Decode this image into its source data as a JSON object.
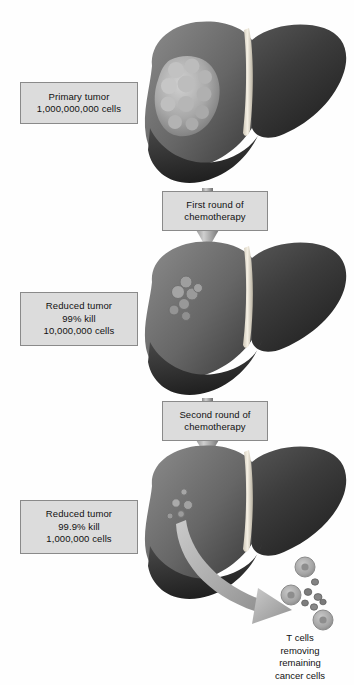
{
  "figure": {
    "title_text": "Tumor cell kill with successive rounds of chemotherapy",
    "background_color": "#ffffff",
    "box_fill": "#dcdcdc",
    "box_border": "#8a8a8a",
    "arrow_color": "#9a9a9a",
    "liver_dark": "#3a3a3a",
    "liver_mid": "#6e6e6e",
    "liver_light": "#9d9d9d",
    "ligament_color": "#efeadd",
    "tumor_color": "#b9b9b9",
    "tcell_color": "#a9a9a9",
    "cancer_cell_color": "#7c7c7c"
  },
  "stages": [
    {
      "id": "stage-1",
      "label_lines": [
        "Primary tumor",
        "1,000,000,000 cells"
      ],
      "cells": "1,000,000,000",
      "kill": "",
      "tumor_size": "large"
    },
    {
      "id": "stage-2",
      "label_lines": [
        "Reduced tumor",
        "99% kill",
        "10,000,000 cells"
      ],
      "cells": "10,000,000",
      "kill": "99%",
      "tumor_size": "small"
    },
    {
      "id": "stage-3",
      "label_lines": [
        "Reduced tumor",
        "99.9% kill",
        "1,000,000 cells"
      ],
      "cells": "1,000,000",
      "kill": "99.9%",
      "tumor_size": "tiny"
    }
  ],
  "treatments": [
    {
      "id": "treatment-1",
      "lines": [
        "First round of",
        "chemotherapy"
      ]
    },
    {
      "id": "treatment-2",
      "lines": [
        "Second round of",
        "chemotherapy"
      ]
    }
  ],
  "tcell_caption": {
    "lines": [
      "T cells",
      "removing",
      "remaining",
      "cancer cells"
    ]
  },
  "icons": {
    "down_arrow": "down-arrow-icon",
    "curved_arrow": "curved-arrow-icon",
    "liver": "liver-icon",
    "tumor": "tumor-mass-icon",
    "tcell": "t-cell-icon",
    "cancer_cell": "cancer-cell-icon"
  }
}
